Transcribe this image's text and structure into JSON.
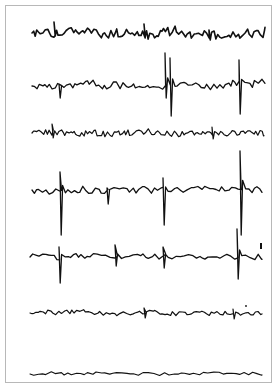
{
  "figure": {
    "frame": {
      "x": 5,
      "y": 5,
      "width": 267,
      "height": 378,
      "border_color": "#b8b8b8"
    },
    "trace_color": "#111111",
    "traces": [
      {
        "id": 1,
        "baseline_y": 33,
        "x_start": 32,
        "x_end": 265,
        "noise_amp": 4.5,
        "period": 2.2,
        "stroke": 1.6,
        "seed": 11,
        "spikes": [
          {
            "x": 54,
            "up": 11,
            "down": 3
          },
          {
            "x": 144,
            "up": 9,
            "down": 4
          },
          {
            "x": 209,
            "up": 3,
            "down": 7
          }
        ]
      },
      {
        "id": 2,
        "baseline_y": 86,
        "x_start": 32,
        "x_end": 265,
        "noise_amp": 4.0,
        "period": 2.8,
        "stroke": 1.3,
        "seed": 23,
        "spikes": [
          {
            "x": 59,
            "up": 2,
            "down": 12
          },
          {
            "x": 165,
            "up": 33,
            "down": 12
          },
          {
            "x": 170,
            "up": 28,
            "down": 30
          },
          {
            "x": 239,
            "up": 26,
            "down": 28
          }
        ]
      },
      {
        "id": 3,
        "baseline_y": 133,
        "x_start": 32,
        "x_end": 264,
        "noise_amp": 3.0,
        "period": 2.0,
        "stroke": 1.2,
        "seed": 37,
        "spikes": [
          {
            "x": 52,
            "up": 9,
            "down": 5
          },
          {
            "x": 212,
            "up": 6,
            "down": 6
          }
        ]
      },
      {
        "id": 4,
        "baseline_y": 190,
        "x_start": 32,
        "x_end": 262,
        "noise_amp": 3.2,
        "period": 3.0,
        "stroke": 1.3,
        "seed": 41,
        "spikes": [
          {
            "x": 60,
            "up": 18,
            "down": 45
          },
          {
            "x": 107,
            "up": 2,
            "down": 14
          },
          {
            "x": 163,
            "up": 12,
            "down": 35
          },
          {
            "x": 240,
            "up": 39,
            "down": 45
          }
        ]
      },
      {
        "id": 5,
        "baseline_y": 257,
        "x_start": 30,
        "x_end": 262,
        "noise_amp": 3.0,
        "period": 3.4,
        "stroke": 1.3,
        "seed": 53,
        "spikes": [
          {
            "x": 59,
            "up": 10,
            "down": 26
          },
          {
            "x": 115,
            "up": 12,
            "down": 9
          },
          {
            "x": 163,
            "up": 10,
            "down": 11
          },
          {
            "x": 237,
            "up": 28,
            "down": 22
          }
        ],
        "marker": {
          "x": 261,
          "y1": 243,
          "y2": 249
        }
      },
      {
        "id": 6,
        "baseline_y": 313,
        "x_start": 30,
        "x_end": 262,
        "noise_amp": 2.2,
        "period": 2.6,
        "stroke": 1.2,
        "seed": 67,
        "spikes": [
          {
            "x": 144,
            "up": 5,
            "down": 5
          },
          {
            "x": 233,
            "up": 4,
            "down": 6
          }
        ],
        "dot": {
          "x": 246,
          "y": 306
        }
      },
      {
        "id": 7,
        "baseline_y": 374,
        "x_start": 30,
        "x_end": 262,
        "noise_amp": 1.6,
        "period": 4.5,
        "stroke": 1.1,
        "seed": 79,
        "spikes": []
      }
    ]
  }
}
